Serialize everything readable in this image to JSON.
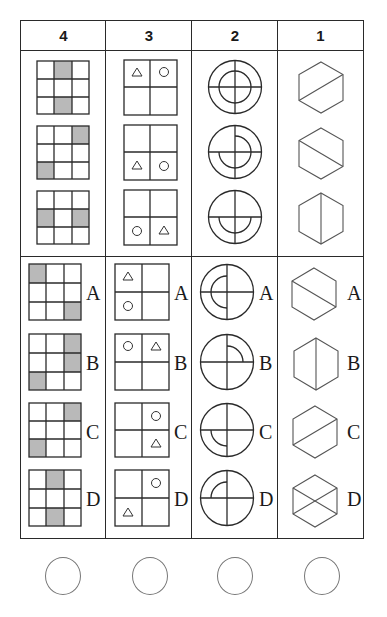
{
  "columns": [
    {
      "header": "4",
      "theme": "3x3 grid with two shaded cells"
    },
    {
      "header": "3",
      "theme": "2x2 grid with triangle and circle"
    },
    {
      "header": "2",
      "theme": "circle with cross and inner arcs"
    },
    {
      "header": "1",
      "theme": "hexagon with diagonal lines"
    }
  ],
  "option_labels": [
    "A",
    "B",
    "C",
    "D"
  ],
  "answer_bubbles": 4,
  "colors": {
    "line": "#2a2a2a",
    "shade": "#b9b9b9",
    "bubble": "#777777"
  },
  "questions": {
    "q4": {
      "sequence_shaded": [
        [
          [
            0,
            1
          ],
          [
            2,
            1
          ]
        ],
        [
          [
            0,
            2
          ],
          [
            2,
            0
          ]
        ],
        [
          [
            1,
            0
          ],
          [
            1,
            2
          ]
        ]
      ],
      "options_shaded": {
        "A": [
          [
            0,
            0
          ],
          [
            2,
            2
          ]
        ],
        "B": [
          [
            0,
            2
          ],
          [
            1,
            2
          ],
          [
            2,
            0
          ]
        ],
        "C": [
          [
            0,
            2
          ],
          [
            2,
            0
          ]
        ],
        "D": [
          [
            0,
            1
          ],
          [
            2,
            1
          ]
        ]
      }
    },
    "q3": {
      "sequence": [
        {
          "triangle": "top-left",
          "circle": "top-right"
        },
        {
          "triangle": "bottom-left",
          "circle": "bottom-right"
        },
        {
          "triangle": "bottom-right",
          "circle": "bottom-left"
        }
      ],
      "options": {
        "A": {
          "triangle": "top-left",
          "circle": "bottom-left"
        },
        "B": {
          "triangle": "top-right",
          "circle": "top-left"
        },
        "C": {
          "triangle": "bottom-right",
          "circle": "top-right"
        },
        "D": {
          "triangle": "bottom-left",
          "circle": "top-right"
        }
      }
    },
    "q2": {
      "sequence_inner_arcs": [
        "full",
        "right-top-to-bottom-left",
        "bottom-half"
      ],
      "options_inner_arcs": {
        "A": "left-half",
        "B": "top-right-quarter",
        "C": "bottom-left-quarter",
        "D": "top-left-quarter"
      }
    },
    "q1": {
      "sequence_lines": [
        "bottom-left-to-top-right",
        "top-left-to-bottom-right",
        "vertical"
      ],
      "options_lines": {
        "A": "top-left-to-bottom-right",
        "B": "vertical",
        "C": "bottom-left-to-top-right",
        "D": "both-diagonals"
      }
    }
  }
}
